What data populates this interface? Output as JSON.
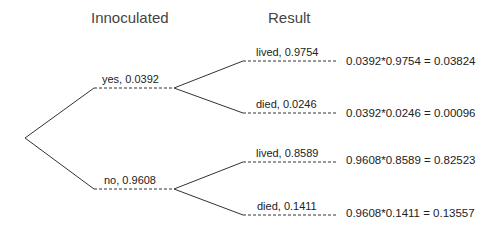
{
  "headers": {
    "level1": "Innoculated",
    "level2": "Result"
  },
  "branches": {
    "yes": {
      "label": "yes,  0.0392"
    },
    "no": {
      "label": "no,  0.9608"
    },
    "yes_lived": {
      "label": "lived,  0.9754",
      "result": "0.0392*0.9754 = 0.03824"
    },
    "yes_died": {
      "label": "died,  0.0246",
      "result": "0.0392*0.0246 = 0.00096"
    },
    "no_lived": {
      "label": "lived,  0.8589",
      "result": "0.9608*0.8589 = 0.82523"
    },
    "no_died": {
      "label": "died,  0.1411",
      "result": "0.9608*0.1411 = 0.13557"
    }
  },
  "colors": {
    "line": "#333333",
    "text": "#222222"
  }
}
